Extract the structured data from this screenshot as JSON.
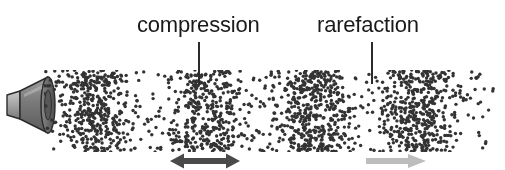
{
  "figure": {
    "background_color": "#ffffff",
    "width": 505,
    "height": 170
  },
  "labels": {
    "compression": {
      "text": "compression",
      "color": "#1a1a1a",
      "leader_name": "compression-leader-line"
    },
    "rarefaction": {
      "text": "rarefaction",
      "color": "#1a1a1a",
      "leader_name": "rarefaction-leader-line"
    }
  },
  "speaker": {
    "name": "loudspeaker-icon",
    "body_color": "#8f8f8f",
    "cone_color": "#6e6e6e",
    "outline_color": "#2b2b2b",
    "highlight_color": "#c9c9c9"
  },
  "arrows": {
    "compression_arrow": {
      "name": "compression-double-arrow",
      "direction": "both",
      "color": "#4a4a4a"
    },
    "rarefaction_arrow": {
      "name": "rarefaction-arrow",
      "direction": "right",
      "color": "#bdbdbd"
    }
  },
  "chart_data": {
    "type": "scatter",
    "xlabel": "",
    "ylabel": "",
    "xlim": [
      44,
      500
    ],
    "ylim": [
      70,
      152
    ],
    "grid": false,
    "legend": null,
    "particle_color": "#333333",
    "particle_radius": 1.7,
    "particle_count": 1850,
    "wavelength": 108,
    "compression_centers": [
      95,
      200,
      305,
      420
    ],
    "rarefaction_centers": [
      145,
      255,
      370,
      475
    ],
    "annotations": [
      {
        "label": "compression",
        "x": 198,
        "y": 84
      },
      {
        "label": "rarefaction",
        "x": 371,
        "y": 84
      }
    ]
  }
}
